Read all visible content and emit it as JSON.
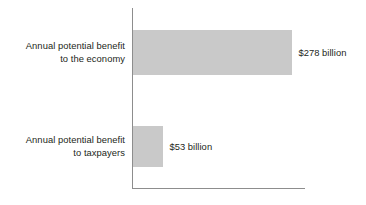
{
  "chart_data": {
    "type": "bar",
    "orientation": "horizontal",
    "title": "",
    "subtitle": "",
    "xlabel": "",
    "ylabel": "",
    "categories": [
      "Annual potential benefit to the economy",
      "Annual potential benefit to taxpayers"
    ],
    "values": [
      278,
      53
    ],
    "unit": "billion USD",
    "value_labels": [
      "$278 billion",
      "$53 billion"
    ],
    "xlim": [
      0,
      300
    ],
    "grid": false,
    "legend": false,
    "legend_position": "none",
    "axis_color": "#8d8d8d",
    "bar_color": "#c9c9c9",
    "text_color": "#231f20",
    "background_color": "#ffffff",
    "bars": [
      {
        "label_line1": "Annual potential benefit",
        "label_line2": "to the economy",
        "value": 278,
        "value_label": "$278 billion"
      },
      {
        "label_line1": "Annual potential benefit",
        "label_line2": "to taxpayers",
        "value": 53,
        "value_label": "$53 billion"
      }
    ]
  }
}
